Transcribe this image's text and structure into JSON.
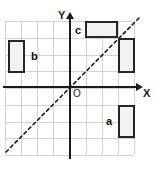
{
  "figure": {
    "type": "coordinate-plane-diagram",
    "width": 155,
    "height": 169,
    "background": "#ffffff"
  },
  "axes": {
    "y_label": "Y",
    "x_label": "X",
    "origin_label": "O",
    "axis_color": "#1a1a1a",
    "y_axis_x": 70,
    "x_axis_y": 87
  },
  "grid": {
    "columns": 8,
    "rows": 8,
    "cell_size": 16.2,
    "left": 5,
    "top": 21,
    "width": 129,
    "height": 134,
    "line_color": "#d2d2d2",
    "visible": true
  },
  "diagonal": {
    "name": "line-y-equals-x",
    "style": "dashed",
    "color": "#1a1a1a",
    "x1": 6,
    "y1": 152,
    "x2": 139,
    "y2": 18
  },
  "shapes": [
    {
      "id": "rect-b",
      "label": "b",
      "x": 8,
      "y": 40,
      "width": 17,
      "height": 33,
      "fill": "#f2f2f2",
      "stroke": "#262626",
      "label_x": 31,
      "label_y": 51
    },
    {
      "id": "rect-c",
      "label": "c",
      "x": 85,
      "y": 21,
      "width": 33,
      "height": 17,
      "fill": "#f2f2f2",
      "stroke": "#262626",
      "label_x": 75,
      "label_y": 25
    },
    {
      "id": "rect-right",
      "label": "",
      "x": 118,
      "y": 38,
      "width": 17,
      "height": 35,
      "fill": "#f2f2f2",
      "stroke": "#262626",
      "label_x": 0,
      "label_y": 0
    },
    {
      "id": "rect-a",
      "label": "a",
      "x": 118,
      "y": 105,
      "width": 17,
      "height": 33,
      "fill": "#f2f2f2",
      "stroke": "#262626",
      "label_x": 106,
      "label_y": 116
    }
  ]
}
